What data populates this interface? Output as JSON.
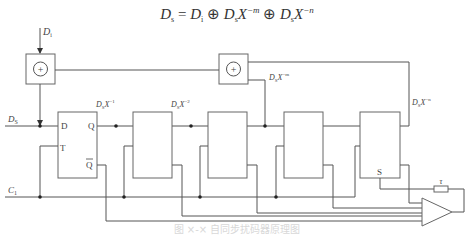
{
  "formula": {
    "lhs": "D",
    "lhs_sub": "s",
    "eq": " = ",
    "t1": "D",
    "t1_sub": "i",
    "xor1": " ⊕ ",
    "t2": "D",
    "t2_sub": "s",
    "t2_x": "X",
    "t2_exp": "−m",
    "xor2": " ⊕ ",
    "t3": "D",
    "t3_sub": "s",
    "t3_x": "X",
    "t3_exp": "−n"
  },
  "labels": {
    "di": {
      "main": "D",
      "sub": "i"
    },
    "ds": {
      "main": "D",
      "sub": "S"
    },
    "c1": {
      "main": "C",
      "sub": "1"
    },
    "tap1": {
      "main": "D",
      "sub": "S",
      "x": "X",
      "exp": "−1"
    },
    "tap2": {
      "main": "D",
      "sub": "S",
      "x": "X",
      "exp": "−2"
    },
    "tapm": {
      "main": "D",
      "sub": "S",
      "x": "X",
      "exp": "−m"
    },
    "tapn": {
      "main": "D",
      "sub": "S",
      "x": "X",
      "exp": "−n"
    },
    "tau": "τ"
  },
  "xor_gates": [
    {
      "symbol": "+"
    },
    {
      "symbol": "+"
    }
  ],
  "flip_flops": [
    {
      "pin_d": "D",
      "pin_q": "Q",
      "pin_t": "T",
      "pin_qbar": "Q"
    },
    {},
    {},
    {},
    {
      "pin_s": "S"
    }
  ],
  "caption": "图 ×-× 自同步扰码器原理图"
}
